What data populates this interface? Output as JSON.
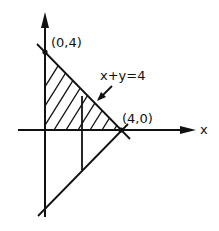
{
  "diagram": {
    "axes": {
      "x_label": "x",
      "y_label": ""
    },
    "points": [
      {
        "label": "(0,4)",
        "x": 0,
        "y": 4
      },
      {
        "label": "(4,0)",
        "x": 4,
        "y": 0
      }
    ],
    "line_label": "x+y=4",
    "shaded_region": "triangle with vertices (0,0), (0,4), (4,0)",
    "colors": {
      "ink": "#111111",
      "background": "#ffffff"
    }
  }
}
